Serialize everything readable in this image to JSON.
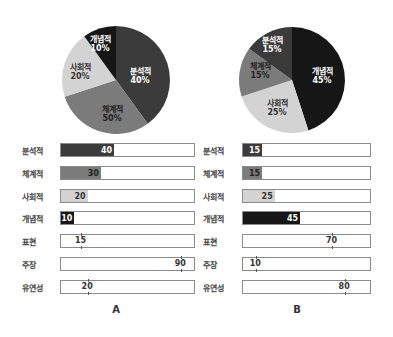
{
  "colors": {
    "분석적": "#3b3b3b",
    "체계적": "#7b7b7b",
    "사회적": "#d3d3d3",
    "개념적": "#161616"
  },
  "chart_data": [
    {
      "type": "pie",
      "title": "A",
      "categories": [
        "분석적",
        "체계적",
        "사회적",
        "개념적"
      ],
      "values": [
        40,
        30,
        20,
        10
      ],
      "slice_labels": [
        "40%",
        "50%",
        "20%",
        "10%"
      ],
      "start_angle": "12 o'clock, clockwise"
    },
    {
      "type": "bar",
      "title": "A",
      "orientation": "horizontal",
      "categories": [
        "분석적",
        "체계적",
        "사회적",
        "개념적"
      ],
      "values": [
        40,
        30,
        20,
        10
      ],
      "xlim": [
        0,
        100
      ]
    },
    {
      "type": "bar",
      "title": "A",
      "style": "marker-on-scale",
      "categories": [
        "표현",
        "주장",
        "유연성"
      ],
      "values": [
        15,
        90,
        20
      ],
      "xlim": [
        0,
        100
      ]
    },
    {
      "type": "pie",
      "title": "B",
      "categories": [
        "개념적",
        "사회적",
        "체계적",
        "분석적"
      ],
      "values": [
        45,
        25,
        15,
        15
      ],
      "slice_labels": [
        "45%",
        "25%",
        "15%",
        "15%"
      ],
      "start_angle": "12 o'clock, clockwise"
    },
    {
      "type": "bar",
      "title": "B",
      "orientation": "horizontal",
      "categories": [
        "분석적",
        "체계적",
        "사회적",
        "개념적"
      ],
      "values": [
        15,
        15,
        25,
        45
      ],
      "xlim": [
        0,
        100
      ]
    },
    {
      "type": "bar",
      "title": "B",
      "style": "marker-on-scale",
      "categories": [
        "표현",
        "주장",
        "유연성"
      ],
      "values": [
        70,
        10,
        80
      ],
      "xlim": [
        0,
        100
      ]
    }
  ],
  "panels": {
    "A": {
      "title": "A",
      "pie": [
        {
          "name": "분석적",
          "label": "40%",
          "value": 40
        },
        {
          "name": "체계적",
          "label": "50%",
          "value": 30
        },
        {
          "name": "사회적",
          "label": "20%",
          "value": 20
        },
        {
          "name": "개념적",
          "label": "10%",
          "value": 10
        }
      ],
      "bars": [
        {
          "name": "분석적",
          "value": "40"
        },
        {
          "name": "체계적",
          "value": "30"
        },
        {
          "name": "사회적",
          "value": "20"
        },
        {
          "name": "개념적",
          "value": "10"
        }
      ],
      "markers": [
        {
          "name": "표현",
          "value": "15"
        },
        {
          "name": "주장",
          "value": "90"
        },
        {
          "name": "유연성",
          "value": "20"
        }
      ]
    },
    "B": {
      "title": "B",
      "pie": [
        {
          "name": "개념적",
          "label": "45%",
          "value": 45
        },
        {
          "name": "사회적",
          "label": "25%",
          "value": 25
        },
        {
          "name": "체계적",
          "label": "15%",
          "value": 15
        },
        {
          "name": "분석적",
          "label": "15%",
          "value": 15
        }
      ],
      "bars": [
        {
          "name": "분석적",
          "value": "15"
        },
        {
          "name": "체계적",
          "value": "15"
        },
        {
          "name": "사회적",
          "value": "25"
        },
        {
          "name": "개념적",
          "value": "45"
        }
      ],
      "markers": [
        {
          "name": "표현",
          "value": "70"
        },
        {
          "name": "주장",
          "value": "10"
        },
        {
          "name": "유연성",
          "value": "80"
        }
      ]
    }
  }
}
